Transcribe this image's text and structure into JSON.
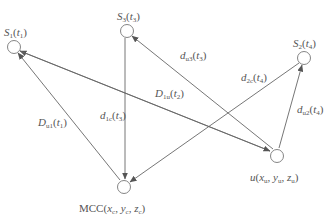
{
  "diagram": {
    "nodes": [
      {
        "id": "S1",
        "label_main": "S",
        "label_sub": "1",
        "label_arg": "t",
        "label_arg_sub": "1",
        "cx": 14,
        "cy": 47
      },
      {
        "id": "S3",
        "label_main": "S",
        "label_sub": "3",
        "label_arg": "t",
        "label_arg_sub": "3",
        "cx": 127,
        "cy": 31
      },
      {
        "id": "S2",
        "label_main": "S",
        "label_sub": "2",
        "label_arg": "t",
        "label_arg_sub": "4",
        "cx": 304,
        "cy": 58
      },
      {
        "id": "u",
        "label_text": "u(x",
        "label_full": "u(x_u, y_u, z_u)",
        "cx": 277,
        "cy": 155
      },
      {
        "id": "MCC",
        "label_full": "MCC(x_c, y_c, z_c)",
        "cx": 124,
        "cy": 186
      }
    ],
    "edges": [
      {
        "from": "MCC",
        "to": "S1",
        "label": "D_u1(t_1)"
      },
      {
        "from": "u",
        "to": "S1",
        "label": "D_1u(t_2)"
      },
      {
        "from": "S1",
        "to": "u",
        "label": ""
      },
      {
        "from": "S3",
        "to": "MCC",
        "label": "d_1c(t_3)"
      },
      {
        "from": "u",
        "to": "S3",
        "label": "d_u3(t_3)"
      },
      {
        "from": "S2",
        "to": "MCC",
        "label": "d_2c(t_4)"
      },
      {
        "from": "u",
        "to": "S2",
        "label": "d_u2(t_4)"
      }
    ],
    "labels": {
      "s1": {
        "a": "S",
        "b": "1",
        "c": "(",
        "d": "t",
        "e": "1",
        "f": ")"
      },
      "s3": {
        "a": "S",
        "b": "3",
        "c": "(",
        "d": "t",
        "e": "3",
        "f": ")"
      },
      "s2": {
        "a": "S",
        "b": "2",
        "c": "(",
        "d": "t",
        "e": "4",
        "f": ")"
      },
      "u": {
        "a": "u",
        "b": "(",
        "c": "x",
        "d": "u",
        "e": ", ",
        "f": "y",
        "g": "u",
        "h": ", ",
        "i": "z",
        "j": "u",
        "k": ")"
      },
      "mcc": {
        "a": "MCC(",
        "c": "x",
        "d": "c",
        "e": ", ",
        "f": "y",
        "g": "c",
        "h": ", ",
        "i": "z",
        "j": "c",
        "k": ")"
      },
      "Du1": {
        "a": "D",
        "b": "u1",
        "c": "(",
        "d": "t",
        "e": "1",
        "f": ")"
      },
      "D1u": {
        "a": "D",
        "b": "1u",
        "c": "(",
        "d": "t",
        "e": "2",
        "f": ")"
      },
      "d1c": {
        "a": "d",
        "b": "1c",
        "c": "(",
        "d": "t",
        "e": "3",
        "f": ")"
      },
      "du3": {
        "a": "d",
        "b": "u3",
        "c": "(",
        "d": "t",
        "e": "3",
        "f": ")"
      },
      "d2c": {
        "a": "d",
        "b": "2c",
        "c": "(",
        "d": "t",
        "e": "4",
        "f": ")"
      },
      "du2": {
        "a": "d",
        "b": "u2",
        "c": "(",
        "d": "t",
        "e": "4",
        "f": ")"
      }
    },
    "colors": {
      "line": "#666666",
      "node": "#777777",
      "text": "#555555"
    }
  }
}
